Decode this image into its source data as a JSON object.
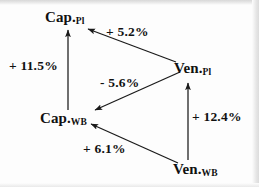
{
  "figure": {
    "type": "directed-graph-diagram",
    "background_color": "#fdfdfd",
    "stroke_color": "#1a1a1a",
    "text_color": "#111111"
  },
  "nodes": [
    {
      "id": "cap-pl",
      "base": "Cap.",
      "subscript": "Pl",
      "full": "Cap.Pl",
      "x": 70,
      "y": 18
    },
    {
      "id": "cap-wb",
      "base": "Cap.",
      "subscript": "WB",
      "full": "Cap.WB",
      "x": 67,
      "y": 119
    },
    {
      "id": "ven-pl",
      "base": "Ven.",
      "subscript": "Pl",
      "full": "Ven.Pl",
      "x": 196,
      "y": 69
    },
    {
      "id": "ven-wb",
      "base": "Ven.",
      "subscript": "WB",
      "full": "Ven.WB",
      "x": 196,
      "y": 170
    }
  ],
  "edges": [
    {
      "id": "cap-wb-to-cap-pl",
      "from": "cap-wb",
      "to": "cap-pl",
      "label": "+ 11.5%",
      "sign": "positive",
      "value": 11.5
    },
    {
      "id": "ven-pl-to-cap-pl",
      "from": "ven-pl",
      "to": "cap-pl",
      "label": "+ 5.2%",
      "sign": "positive",
      "value": 5.2
    },
    {
      "id": "ven-pl-to-cap-wb",
      "from": "ven-pl",
      "to": "cap-wb",
      "label": "- 5.6%",
      "sign": "negative",
      "value": -5.6
    },
    {
      "id": "ven-wb-to-cap-wb",
      "from": "ven-wb",
      "to": "cap-wb",
      "label": "+ 6.1%",
      "sign": "positive",
      "value": 6.1
    },
    {
      "id": "ven-wb-to-ven-pl",
      "from": "ven-wb",
      "to": "ven-pl",
      "label": "+ 12.4%",
      "sign": "positive",
      "value": 12.4
    }
  ]
}
